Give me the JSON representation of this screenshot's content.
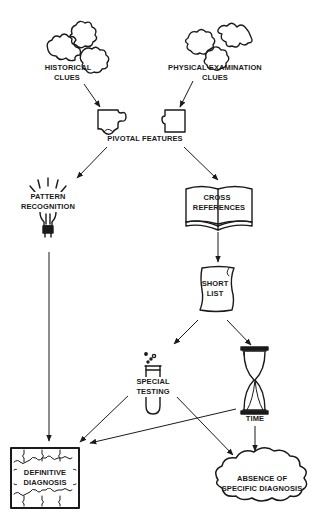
{
  "diagram": {
    "colors": {
      "ink": "#1a1a1a",
      "background": "#ffffff"
    },
    "nodes": {
      "historical": {
        "line1": "HISTORICAL",
        "line2": "CLUES",
        "icon": "puzzle-pieces-icon"
      },
      "physical": {
        "line1": "PHYSICAL EXAMINATION",
        "line2": "CLUES",
        "icon": "puzzle-pieces-icon"
      },
      "pivotal": {
        "label": "PIVOTAL FEATURES",
        "icon": "interlocking-puzzle-pieces-icon"
      },
      "pattern": {
        "line1": "PATTERN",
        "line2": "RECOGNITION",
        "icon": "light-bulb-icon"
      },
      "cross": {
        "line1": "CROSS",
        "line2": "REFERENCES",
        "icon": "open-book-icon"
      },
      "short": {
        "line1": "SHORT",
        "line2": "LIST",
        "icon": "scroll-icon"
      },
      "special": {
        "line1": "SPECIAL",
        "line2": "TESTING",
        "icon": "test-tube-icon"
      },
      "time": {
        "label": "TIME",
        "icon": "hourglass-icon"
      },
      "definitive": {
        "line1": "DEFINITIVE",
        "line2": "DIAGNOSIS",
        "icon": "jigsaw-frame-icon"
      },
      "absence": {
        "line1": "ABSENCE OF",
        "line2": "SPECIFIC DIAGNOSIS",
        "icon": "cloud-icon"
      }
    },
    "edges": [
      {
        "from": "HISTORICAL CLUES",
        "to": "PIVOTAL FEATURES"
      },
      {
        "from": "PHYSICAL EXAMINATION CLUES",
        "to": "PIVOTAL FEATURES"
      },
      {
        "from": "PIVOTAL FEATURES",
        "to": "PATTERN RECOGNITION"
      },
      {
        "from": "PIVOTAL FEATURES",
        "to": "CROSS REFERENCES"
      },
      {
        "from": "CROSS REFERENCES",
        "to": "SHORT LIST"
      },
      {
        "from": "SHORT LIST",
        "to": "SPECIAL TESTING"
      },
      {
        "from": "SHORT LIST",
        "to": "TIME"
      },
      {
        "from": "PATTERN RECOGNITION",
        "to": "DEFINITIVE DIAGNOSIS"
      },
      {
        "from": "SPECIAL TESTING",
        "to": "DEFINITIVE DIAGNOSIS"
      },
      {
        "from": "TIME",
        "to": "DEFINITIVE DIAGNOSIS"
      },
      {
        "from": "SPECIAL TESTING",
        "to": "ABSENCE OF SPECIFIC DIAGNOSIS"
      },
      {
        "from": "TIME",
        "to": "ABSENCE OF SPECIFIC DIAGNOSIS"
      }
    ]
  }
}
